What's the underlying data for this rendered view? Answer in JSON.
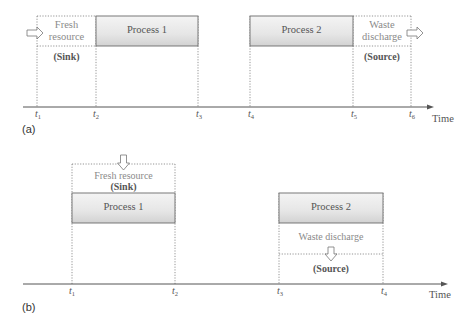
{
  "colors": {
    "process_fill_top": "#f2f2f2",
    "process_fill_bottom": "#dcdcdc",
    "process_border": "#6a6a6a",
    "dotted": "#777777",
    "axis": "#555555",
    "text_dark": "#444444",
    "text_light": "#8a8a8a"
  },
  "panel_a": {
    "label": "(a)",
    "axis_label": "Time",
    "ticks": [
      {
        "base": "t",
        "sub": "1"
      },
      {
        "base": "t",
        "sub": "2"
      },
      {
        "base": "t",
        "sub": "3"
      },
      {
        "base": "t",
        "sub": "4"
      },
      {
        "base": "t",
        "sub": "5"
      },
      {
        "base": "t",
        "sub": "6"
      }
    ],
    "fresh_resource": {
      "line1": "Fresh",
      "line2": "resource",
      "role": "(Sink)"
    },
    "process1": "Process 1",
    "process2": "Process 2",
    "waste_discharge": {
      "line1": "Waste",
      "line2": "discharge",
      "role": "(Source)"
    }
  },
  "panel_b": {
    "label": "(b)",
    "axis_label": "Time",
    "ticks": [
      {
        "base": "t",
        "sub": "1"
      },
      {
        "base": "t",
        "sub": "2"
      },
      {
        "base": "t",
        "sub": "3"
      },
      {
        "base": "t",
        "sub": "4"
      }
    ],
    "fresh_resource": {
      "text": "Fresh resource",
      "role": "(Sink)"
    },
    "process1": "Process 1",
    "process2": "Process 2",
    "waste_discharge": {
      "text": "Waste discharge",
      "role": "(Source)"
    }
  }
}
